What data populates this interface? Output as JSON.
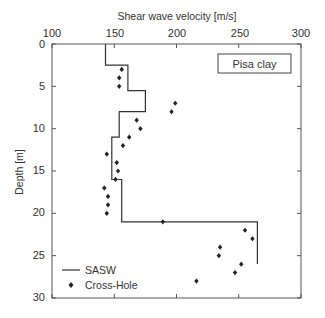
{
  "chart_data": {
    "type": "scatter",
    "title": "",
    "xlabel": "Shear wave velocity [m/s]",
    "ylabel": "Depth [m]",
    "xlim": [
      100,
      300
    ],
    "ylim": [
      30,
      0
    ],
    "x_axis_position": "top",
    "y_inverted": true,
    "xticks": [
      100,
      150,
      200,
      250,
      300
    ],
    "yticks": [
      0,
      5,
      10,
      15,
      20,
      25,
      30
    ],
    "grid": false,
    "legend_position": "lower left",
    "annotation": "Pisa clay",
    "series": [
      {
        "name": "SASW",
        "style": "step-line",
        "points": [
          [
            143,
            0
          ],
          [
            143,
            2.5
          ],
          [
            161,
            2.5
          ],
          [
            161,
            5.5
          ],
          [
            175,
            5.5
          ],
          [
            175,
            8
          ],
          [
            154,
            8
          ],
          [
            154,
            11
          ],
          [
            148,
            11
          ],
          [
            148,
            16
          ],
          [
            156,
            16
          ],
          [
            156,
            21
          ],
          [
            265,
            21
          ],
          [
            265,
            26
          ]
        ]
      },
      {
        "name": "Cross-Hole",
        "style": "markers",
        "points": [
          [
            156,
            3
          ],
          [
            154,
            4
          ],
          [
            154,
            5
          ],
          [
            199,
            7
          ],
          [
            196,
            8
          ],
          [
            168,
            9
          ],
          [
            171,
            10
          ],
          [
            162,
            11
          ],
          [
            157,
            12
          ],
          [
            144,
            13
          ],
          [
            152,
            14
          ],
          [
            153,
            15
          ],
          [
            151,
            16
          ],
          [
            142,
            17
          ],
          [
            145,
            18
          ],
          [
            145,
            19
          ],
          [
            144,
            20
          ],
          [
            189,
            21
          ],
          [
            255,
            22
          ],
          [
            261,
            23
          ],
          [
            235,
            24
          ],
          [
            234,
            25
          ],
          [
            252,
            26
          ],
          [
            247,
            27
          ],
          [
            216,
            28
          ]
        ]
      }
    ]
  },
  "labels": {
    "xlabel": "Shear wave velocity [m/s]",
    "ylabel": "Depth [m]",
    "annotation": "Pisa clay",
    "legend_sasw": "SASW",
    "legend_crosshole": "Cross-Hole",
    "xticks": [
      "100",
      "150",
      "200",
      "250",
      "300"
    ],
    "yticks": [
      "0",
      "5",
      "10",
      "15",
      "20",
      "25",
      "30"
    ]
  },
  "colors": {
    "line": "#333333",
    "marker": "#222222",
    "axis": "#555555"
  }
}
